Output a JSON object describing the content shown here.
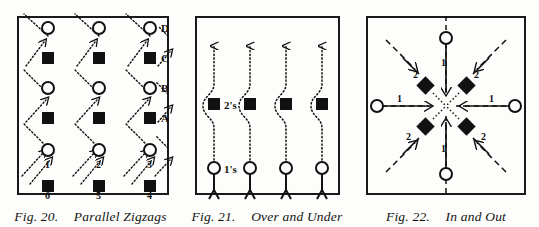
{
  "page": {
    "background": "#fdfdfb",
    "ink": "#111111"
  },
  "figures": [
    {
      "id": "fig-20",
      "caption_number": "Fig. 20.",
      "caption_title": "Parallel Zigzags",
      "frame": {
        "x": 17,
        "y": 16,
        "w": 152,
        "h": 179
      },
      "node_labels_right": [
        "A",
        "B",
        "C",
        "D"
      ],
      "node_labels_bottom": [
        "1",
        "2",
        "3",
        "6",
        "5",
        "4"
      ],
      "column_x": [
        48,
        99,
        150
      ],
      "row_y": [
        28,
        58,
        88,
        118,
        148,
        183
      ],
      "row_shapes": [
        "circle",
        "square",
        "circle",
        "square",
        "circle",
        "square"
      ],
      "path_style": "dotted",
      "arrow_direction": "up-right"
    },
    {
      "id": "fig-21",
      "caption_number": "Fig. 21.",
      "caption_title": "Over and Under",
      "frame": {
        "x": 14,
        "y": 16,
        "w": 145,
        "h": 179
      },
      "label_upper": "2's",
      "label_lower": "1's",
      "column_x": [
        33,
        69,
        105,
        141
      ],
      "square_y": 104,
      "circle_y": 168,
      "path_style": "dotted",
      "arrow_direction": "up"
    },
    {
      "id": "fig-22",
      "caption_number": "Fig. 22.",
      "caption_title": "In and Out",
      "frame": {
        "x": 13,
        "y": 16,
        "w": 160,
        "h": 179
      },
      "center": {
        "x": 93,
        "y": 106
      },
      "axis_labels": [
        "1",
        "1",
        "1",
        "1"
      ],
      "diagonal_labels": [
        "2",
        "2",
        "2",
        "2"
      ],
      "axis_node_shape": "circle",
      "diagonal_node_shape": "diamond",
      "path_style": "dashed"
    }
  ]
}
